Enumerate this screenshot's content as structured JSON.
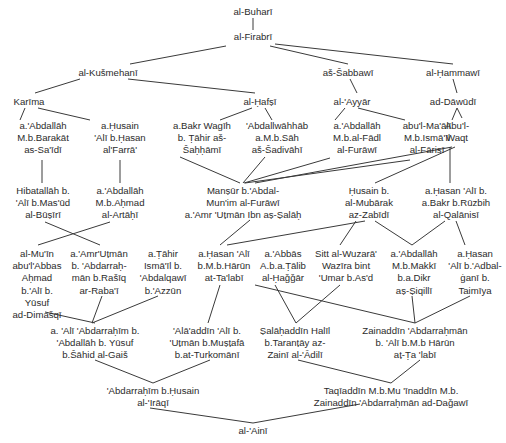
{
  "diagram": {
    "type": "isnad-transmission-tree",
    "nodes": [
      {
        "id": "buhari",
        "x": 253,
        "y": 6,
        "lines": [
          "al-Buharī"
        ]
      },
      {
        "id": "firabri",
        "x": 253,
        "y": 31,
        "lines": [
          "al-Firabrī"
        ]
      },
      {
        "id": "kusmehani",
        "x": 108,
        "y": 67,
        "lines": [
          "al-Kušmehanī"
        ]
      },
      {
        "id": "sabbawi",
        "x": 348,
        "y": 67,
        "lines": [
          "aš-Šabbawī"
        ]
      },
      {
        "id": "hammawi",
        "x": 453,
        "y": 67,
        "lines": [
          "al-Ḥammawī"
        ]
      },
      {
        "id": "karima",
        "x": 29,
        "y": 96,
        "lines": [
          "Karīma"
        ]
      },
      {
        "id": "hafsi",
        "x": 260,
        "y": 96,
        "lines": [
          "al-Ḥafṣī"
        ]
      },
      {
        "id": "ayyar",
        "x": 352,
        "y": 96,
        "lines": [
          "al-'Ayyār"
        ]
      },
      {
        "id": "dawudi",
        "x": 453,
        "y": 96,
        "lines": [
          "ad-Dāwūdī"
        ]
      },
      {
        "id": "abdallah_sadi",
        "x": 43,
        "y": 120,
        "lines": [
          "a.'Abdallāh",
          "M.b.Barakāt",
          "as-Sa'īdī"
        ]
      },
      {
        "id": "husain_farra",
        "x": 120,
        "y": 120,
        "lines": [
          "a.Ḥusain",
          "'Alī b.Ḥasan",
          "al'Farrā'"
        ]
      },
      {
        "id": "bakr_sahhami",
        "x": 202,
        "y": 120,
        "lines": [
          "a.Bakr Wagīh",
          "b. Ṭāhir aš-",
          "Šaḥḥāmī"
        ]
      },
      {
        "id": "abdalwahhab",
        "x": 277,
        "y": 120,
        "lines": [
          "'Abdallwāhhāb",
          "a.M.b.Sāh",
          "aš-Šadivāhī"
        ]
      },
      {
        "id": "abdallah_furawi",
        "x": 357,
        "y": 120,
        "lines": [
          "a.'Abdallāh",
          "M.b.al-Fādl",
          "al-Furāwī"
        ]
      },
      {
        "id": "maali_farisi",
        "x": 427,
        "y": 120,
        "lines": [
          "abu'l-Ma'ālī",
          "M.b.Ismā'īl",
          "al-Fārisī"
        ]
      },
      {
        "id": "abul_waqt",
        "x": 457,
        "y": 120,
        "lines": [
          "Abu'l-",
          "Waqt"
        ]
      },
      {
        "id": "hibatallah",
        "x": 43,
        "y": 185,
        "lines": [
          "Hibatallāh b.",
          "'Alī b.Mas'ūd",
          "al-Būṣīrī"
        ]
      },
      {
        "id": "abdallah_artahi",
        "x": 120,
        "y": 185,
        "lines": [
          "a.'Abdallāh",
          "M.b.Aḥmad",
          "al-Artāḥī"
        ]
      },
      {
        "id": "mansur",
        "x": 243,
        "y": 185,
        "lines": [
          "Manṣūr b.'Abdal-",
          "Mun'im al-Furāwī",
          "a.'Amr 'Uṭmān Ibn aṣ-Ṣalāḥ"
        ]
      },
      {
        "id": "husain_zabidi",
        "x": 369,
        "y": 185,
        "lines": [
          "Ḥusain b.",
          "al-Mubārak",
          "az-Zabīdī"
        ]
      },
      {
        "id": "hasan_qalanisi",
        "x": 456,
        "y": 185,
        "lines": [
          "a.Ḥasan 'Alī b.",
          "a.Bakr b.Rūzbih",
          "al-Qalānisī"
        ]
      },
      {
        "id": "muin",
        "x": 37,
        "y": 248,
        "lines": [
          "al-Mu'īn",
          "abu'l'Abbas",
          "Aḥmad",
          "b.'Alī b.",
          "Yūsuf",
          "ad-Dimašqī"
        ]
      },
      {
        "id": "amr_rabai",
        "x": 99,
        "y": 248,
        "lines": [
          "a.'Amr'Uṭmān",
          "b. 'Abdarraḥ-",
          "mān b.Rašīq",
          "ar-Raba'ī"
        ]
      },
      {
        "id": "tahir",
        "x": 163,
        "y": 248,
        "lines": [
          "a.Ṭāhir",
          "Ismā'īl b.",
          "'Abdalqawī",
          "b.'Azzūn"
        ]
      },
      {
        "id": "hasan_talabi",
        "x": 224,
        "y": 248,
        "lines": [
          "a.Ḥasan 'Alī",
          "b.M.b.Hārūn",
          "at-Ta'labī"
        ]
      },
      {
        "id": "abbas_hagar",
        "x": 283,
        "y": 248,
        "lines": [
          "a.'Abbās",
          "A.b.a.Ṭālib",
          "al-Ḥaǧǧār"
        ]
      },
      {
        "id": "sitt",
        "x": 346,
        "y": 248,
        "lines": [
          "Sitt al-Wuzarā'",
          "Wazīra bint",
          "'Umar b.As'd"
        ]
      },
      {
        "id": "abdallah_siqilli",
        "x": 414,
        "y": 248,
        "lines": [
          "a.'Abdallāh",
          "M.b.Makkī",
          "b.a.Dikr",
          "aṣ-Ṣiqillī"
        ]
      },
      {
        "id": "hasan_taimiya",
        "x": 475,
        "y": 248,
        "lines": [
          "a.Ḥasan",
          "'Alī b.'Adbal-",
          "ġanī b.",
          "Taimīya"
        ]
      },
      {
        "id": "ali_gais",
        "x": 95,
        "y": 325,
        "lines": [
          "a. 'Alī 'Abdarraḥīm b.",
          "'Abdallāh b. Yūsuf",
          "b.Šāhid al-Gaiš"
        ]
      },
      {
        "id": "alaaddin",
        "x": 207,
        "y": 325,
        "lines": [
          "'Alā'addīn 'Alī  b.",
          "'Uṭmān b.Muṣṭafā",
          "b.at-Turkomānī"
        ]
      },
      {
        "id": "salahaddin",
        "x": 295,
        "y": 325,
        "lines": [
          "Ṣalāḥaddīn Halīl",
          "b.Taranṭāy az-",
          "Zainī al-'Ādilī"
        ]
      },
      {
        "id": "zainaddin",
        "x": 415,
        "y": 325,
        "lines": [
          "Zainaddīn 'Abdarraḥmān",
          "b. 'Alī b.M.b Hārūn",
          "aṭ-Ṭa 'labī"
        ]
      },
      {
        "id": "iraqi",
        "x": 153,
        "y": 385,
        "lines": [
          "'Abdarraḥīm b.Ḥusain",
          "al-'Irāqī"
        ]
      },
      {
        "id": "taqiaddin",
        "x": 391,
        "y": 385,
        "lines": [
          "Taqīaddīn M.b.Mu 'īnaddīn M.b.",
          "Zainaddīn 'Abdarraḥmān ad-Daǧawī"
        ]
      },
      {
        "id": "aini",
        "x": 253,
        "y": 425,
        "lines": [
          "al-'Ainī"
        ]
      }
    ],
    "edges": [
      [
        253,
        18,
        253,
        30
      ],
      [
        226,
        46,
        130,
        64
      ],
      [
        270,
        46,
        348,
        64
      ],
      [
        275,
        44,
        453,
        64
      ],
      [
        80,
        79,
        35,
        93
      ],
      [
        128,
        79,
        255,
        93
      ],
      [
        350,
        79,
        357,
        93
      ],
      [
        453,
        79,
        457,
        93
      ],
      [
        25,
        108,
        20,
        120
      ],
      [
        38,
        108,
        90,
        120
      ],
      [
        252,
        108,
        220,
        120
      ],
      [
        265,
        108,
        272,
        120
      ],
      [
        345,
        108,
        335,
        120
      ],
      [
        358,
        108,
        405,
        120
      ],
      [
        457,
        108,
        452,
        120
      ],
      [
        42,
        160,
        42,
        183
      ],
      [
        120,
        160,
        120,
        183
      ],
      [
        180,
        157,
        240,
        183
      ],
      [
        265,
        157,
        243,
        183
      ],
      [
        330,
        158,
        244,
        183
      ],
      [
        410,
        160,
        245,
        183
      ],
      [
        452,
        147,
        255,
        183
      ],
      [
        455,
        147,
        375,
        183
      ],
      [
        457,
        108,
        462,
        118
      ],
      [
        450,
        147,
        450,
        183
      ],
      [
        45,
        222,
        100,
        245
      ],
      [
        110,
        222,
        38,
        245
      ],
      [
        250,
        220,
        220,
        245
      ],
      [
        365,
        221,
        227,
        245
      ],
      [
        356,
        221,
        340,
        245
      ],
      [
        375,
        221,
        412,
        245
      ],
      [
        445,
        221,
        412,
        245
      ],
      [
        456,
        221,
        465,
        245
      ],
      [
        45,
        312,
        95,
        323
      ],
      [
        102,
        296,
        92,
        323
      ],
      [
        158,
        296,
        92,
        323
      ],
      [
        220,
        285,
        208,
        323
      ],
      [
        275,
        285,
        296,
        323
      ],
      [
        340,
        285,
        296,
        323
      ],
      [
        255,
        285,
        415,
        323
      ],
      [
        412,
        296,
        415,
        323
      ],
      [
        470,
        296,
        415,
        323
      ],
      [
        95,
        360,
        153,
        383
      ],
      [
        210,
        360,
        153,
        383
      ],
      [
        298,
        360,
        391,
        383
      ],
      [
        420,
        360,
        391,
        383
      ],
      [
        150,
        408,
        253,
        423
      ],
      [
        360,
        404,
        253,
        423
      ]
    ]
  }
}
